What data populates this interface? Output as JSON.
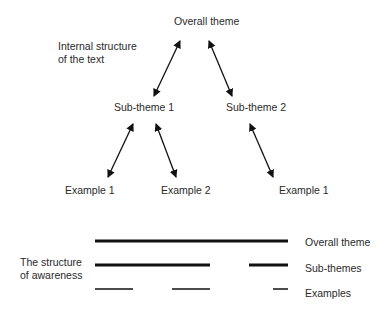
{
  "tree": {
    "title_label": "Internal structure\nof the text",
    "title_lines": [
      "Internal structure",
      "of the text"
    ],
    "root": "Overall theme",
    "subthemes": [
      "Sub-theme 1",
      "Sub-theme 2"
    ],
    "examples": [
      "Example 1",
      "Example 2",
      "Example 1"
    ]
  },
  "awareness": {
    "title_lines": [
      "The structure",
      "of awareness"
    ],
    "rows": [
      {
        "label": "Overall theme",
        "segments": [
          [
            95,
            288
          ]
        ],
        "thickness": 3
      },
      {
        "label": "Sub-themes",
        "segments": [
          [
            95,
            210
          ],
          [
            249,
            288
          ]
        ],
        "thickness": 3
      },
      {
        "label": "Examples",
        "segments": [
          [
            95,
            133
          ],
          [
            172,
            210
          ],
          [
            273,
            288
          ]
        ],
        "thickness": 1.5
      }
    ]
  },
  "colors": {
    "line": "#111111",
    "text": "#2a2a2a"
  }
}
